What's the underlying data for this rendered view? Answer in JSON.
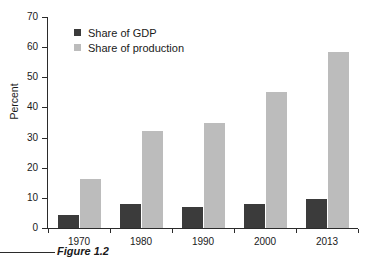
{
  "chart_data": {
    "type": "bar",
    "title": "",
    "categories": [
      "1970",
      "1980",
      "1990",
      "2000",
      "2013"
    ],
    "series": [
      {
        "name": "Share of GDP",
        "values": [
          4.3,
          8.0,
          7.0,
          7.9,
          9.6
        ],
        "color": "#3b3b3b"
      },
      {
        "name": "Share of production",
        "values": [
          16.2,
          32.3,
          35.0,
          45.2,
          58.3
        ],
        "color": "#bcbcbc"
      }
    ],
    "xlabel": "",
    "ylabel": "Percent",
    "ylim": [
      0,
      70
    ],
    "yticks": [
      0,
      10,
      20,
      30,
      40,
      50,
      60,
      70
    ],
    "ytick_labels": [
      "0",
      "10",
      "20",
      "30",
      "40",
      "50",
      "60",
      "70"
    ],
    "grid": false,
    "legend_position": "top-left"
  },
  "legend": {
    "items": [
      {
        "label": "Share of GDP"
      },
      {
        "label": "Share of production"
      }
    ]
  },
  "caption": {
    "text": "Figure 1.2"
  }
}
